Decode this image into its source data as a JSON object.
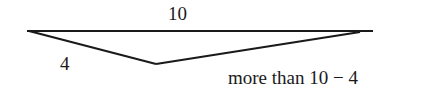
{
  "diagram": {
    "type": "triangle",
    "stroke_color": "#1a1a1a",
    "vertices": {
      "left": [
        27,
        31
      ],
      "right": [
        373,
        31
      ],
      "bottom": [
        156,
        64
      ]
    },
    "labels": {
      "top_side": "10",
      "left_side": "4",
      "right_side": "more than 10 − 4"
    }
  }
}
